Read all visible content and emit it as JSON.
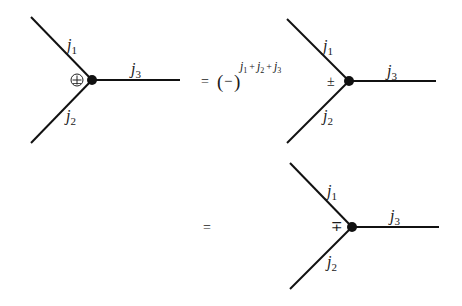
{
  "diagrams": [
    {
      "id": "lhs",
      "labels": {
        "j1": "j",
        "j1_sub": "1",
        "j2": "j",
        "j2_sub": "2",
        "j3": "j",
        "j3_sub": "3"
      },
      "vertex_symbol": "+",
      "vertex_symbol_style": "circled-plus",
      "geometry": {
        "vertex": [
          92,
          80
        ],
        "upper_end": [
          31,
          17
        ],
        "lower_end": [
          31,
          143
        ],
        "right_end": [
          180,
          80
        ]
      }
    },
    {
      "id": "rhs-1",
      "labels": {
        "j1": "j",
        "j1_sub": "1",
        "j2": "j",
        "j2_sub": "2",
        "j3": "j",
        "j3_sub": "3"
      },
      "vertex_symbol": "±",
      "geometry": {
        "vertex": [
          349,
          81
        ],
        "upper_end": [
          287,
          19
        ],
        "lower_end": [
          287,
          143
        ],
        "right_end": [
          436,
          81
        ]
      }
    },
    {
      "id": "rhs-2",
      "labels": {
        "j1": "j",
        "j1_sub": "1",
        "j2": "j",
        "j2_sub": "2",
        "j3": "j",
        "j3_sub": "3"
      },
      "vertex_symbol": "∓",
      "geometry": {
        "vertex": [
          352,
          227
        ],
        "upper_end": [
          290,
          163
        ],
        "lower_end": [
          290,
          289
        ],
        "right_end": [
          439,
          227
        ]
      }
    }
  ],
  "equation_1": {
    "equals": "=",
    "open_paren": "(",
    "minus": "−",
    "close_paren": ")",
    "exponent": {
      "j1": "j",
      "j1_sub": "1",
      "plus1": "+",
      "j2": "j",
      "j2_sub": "2",
      "plus2": "+",
      "j3": "j",
      "j3_sub": "3"
    }
  },
  "equation_2": {
    "equals": "="
  },
  "colors": {
    "line": "#111111",
    "text": "#1a1a1a",
    "background": "#ffffff"
  }
}
